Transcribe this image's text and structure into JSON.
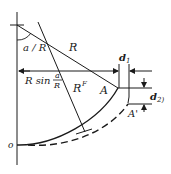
{
  "diagram": {
    "colors": {
      "ink": "#1a1a1a",
      "background": "#ffffff"
    },
    "labels": {
      "angle": "a / R",
      "radius": "R",
      "projection_prefix": "R sin",
      "fraction_num": "a",
      "fraction_den": "R",
      "radius_f": "R",
      "radius_f_sup": "F",
      "point_a": "A",
      "point_a_prime": "A'",
      "d1": "d",
      "d1_sub": "1",
      "d2": "d",
      "d2_sub": "2)",
      "origin": "o"
    },
    "elements": [
      "vertical axis",
      "radius line R",
      "radius line R^F",
      "horizontal dimension R sin(a/R)",
      "solid arc to A",
      "dashed arc to A'",
      "dimension d1 (horizontal offset)",
      "dimension d2 (vertical offset)"
    ]
  }
}
